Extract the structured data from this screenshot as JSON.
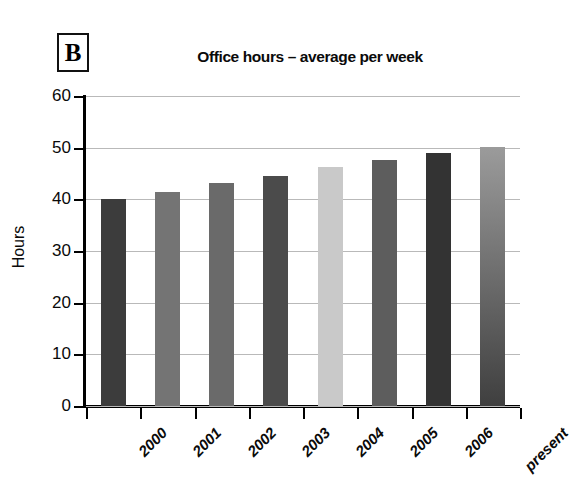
{
  "panel": {
    "label": "B"
  },
  "chart_data": {
    "type": "bar",
    "title": "Office hours – average per week",
    "xlabel": "",
    "ylabel": "Hours",
    "categories": [
      "2000",
      "2001",
      "2002",
      "2003",
      "2004",
      "2005",
      "2006",
      "present"
    ],
    "values": [
      40.0,
      41.4,
      43.2,
      44.6,
      46.2,
      47.6,
      49.0,
      50.2
    ],
    "ylim": [
      0,
      60
    ],
    "yticks": [
      0,
      10,
      20,
      30,
      40,
      50,
      60
    ],
    "ytick_labels": [
      "0",
      "10",
      "20",
      "30",
      "40",
      "50",
      "60"
    ],
    "grid": true,
    "grid_axis": "y",
    "legend": "none",
    "bar_colors": [
      "#3c3c3c",
      "#747474",
      "#6a6a6a",
      "#4b4b4b",
      "#c9c9c9",
      "#5d5d5d",
      "#333333",
      "#9b9b9b"
    ],
    "background_color": "#ffffff",
    "gridline_color": "#b9b9b9",
    "axis_color": "#000000"
  }
}
